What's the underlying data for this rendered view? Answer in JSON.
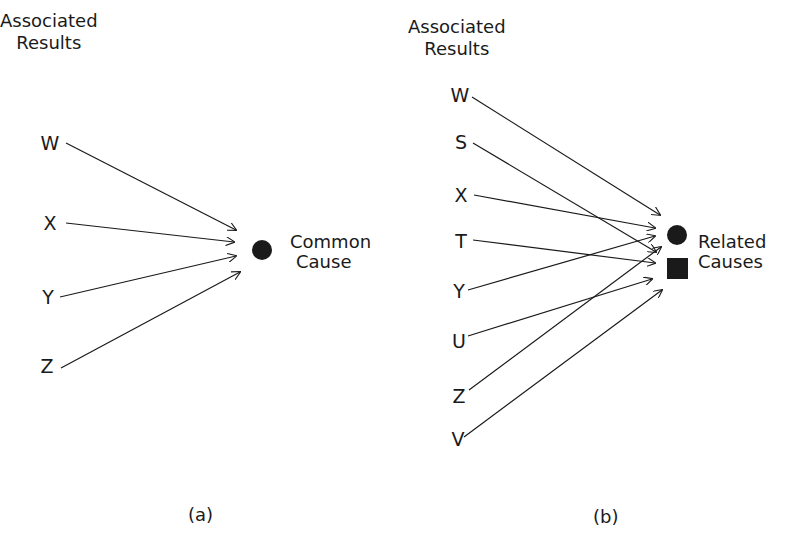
{
  "panel_a": {
    "header_line1": "Associated",
    "header_line2": "Results",
    "nodes": [
      "W",
      "X",
      "Y",
      "Z"
    ],
    "target_line1": "Common",
    "target_line2": "Cause",
    "caption": "(a)"
  },
  "panel_b": {
    "header_line1": "Associated",
    "header_line2": "Results",
    "nodes": [
      "W",
      "S",
      "X",
      "T",
      "Y",
      "U",
      "Z",
      "V"
    ],
    "target_line1": "Related",
    "target_line2": "Causes",
    "caption": "(b)"
  },
  "colors": {
    "ink": "#1a1a1a",
    "background": "#ffffff"
  }
}
